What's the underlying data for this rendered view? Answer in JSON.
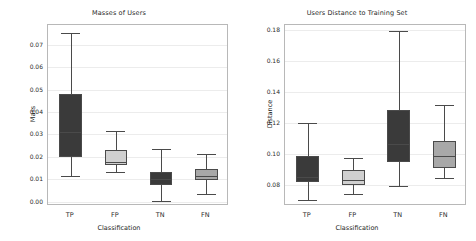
{
  "figure": {
    "width": 476,
    "height": 241,
    "background": "#ffffff"
  },
  "style": {
    "dark_fill": "#3a3a3a",
    "light_fill": "#d0d0d0",
    "line_color": "#4a4a4a",
    "grid_color": "#ececec",
    "frame_color": "#b8b8b8"
  },
  "chart_data": [
    {
      "type": "box",
      "panel": "left",
      "title": "Masses of Users",
      "xlabel": "Classification",
      "ylabel": "Mass",
      "grid": true,
      "legend": "none",
      "categories": [
        "TP",
        "FP",
        "TN",
        "FN"
      ],
      "ylim": [
        -0.002,
        0.079
      ],
      "yticks": [
        0.0,
        0.01,
        0.02,
        0.03,
        0.04,
        0.05,
        0.06,
        0.07
      ],
      "ytick_labels": [
        "0.00",
        "0.01",
        "0.02",
        "0.03",
        "0.04",
        "0.05",
        "0.06",
        "0.07"
      ],
      "boxes": [
        {
          "category": "TP",
          "whisker_low": 0.0115,
          "q1": 0.02,
          "median": 0.031,
          "q3": 0.048,
          "whisker_high": 0.0755,
          "fill": "#3a3a3a"
        },
        {
          "category": "FP",
          "whisker_low": 0.0133,
          "q1": 0.0163,
          "median": 0.0178,
          "q3": 0.0232,
          "whisker_high": 0.0315,
          "fill": "#d0d0d0"
        },
        {
          "category": "TN",
          "whisker_low": 0.0001,
          "q1": 0.0072,
          "median": 0.0102,
          "q3": 0.0133,
          "whisker_high": 0.0235,
          "fill": "#3a3a3a"
        },
        {
          "category": "FN",
          "whisker_low": 0.0033,
          "q1": 0.0098,
          "median": 0.0116,
          "q3": 0.0145,
          "whisker_high": 0.0213,
          "fill": "#a8a8a8"
        }
      ]
    },
    {
      "type": "box",
      "panel": "right",
      "title": "Users Distance to Training Set",
      "xlabel": "Classification",
      "ylabel": "Distance",
      "grid": true,
      "legend": "none",
      "categories": [
        "TP",
        "FP",
        "TN",
        "FN"
      ],
      "ylim": [
        0.0665,
        0.1835
      ],
      "yticks": [
        0.08,
        0.1,
        0.12,
        0.14,
        0.16,
        0.18
      ],
      "ytick_labels": [
        "0.08",
        "0.10",
        "0.12",
        "0.14",
        "0.16",
        "0.18"
      ],
      "boxes": [
        {
          "category": "TP",
          "whisker_low": 0.0705,
          "q1": 0.0822,
          "median": 0.0855,
          "q3": 0.0985,
          "whisker_high": 0.12,
          "fill": "#3a3a3a"
        },
        {
          "category": "FP",
          "whisker_low": 0.074,
          "q1": 0.08,
          "median": 0.0833,
          "q3": 0.09,
          "whisker_high": 0.0973,
          "fill": "#d0d0d0"
        },
        {
          "category": "TN",
          "whisker_low": 0.0795,
          "q1": 0.0952,
          "median": 0.1065,
          "q3": 0.1288,
          "whisker_high": 0.1795,
          "fill": "#3a3a3a"
        },
        {
          "category": "FN",
          "whisker_low": 0.0843,
          "q1": 0.0908,
          "median": 0.0985,
          "q3": 0.1082,
          "whisker_high": 0.1315,
          "fill": "#a8a8a8"
        }
      ]
    }
  ]
}
